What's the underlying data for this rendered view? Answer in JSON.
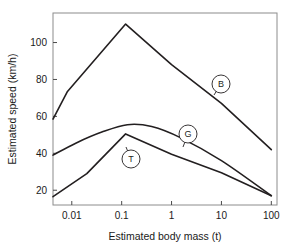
{
  "chart_data": {
    "type": "line",
    "title": "",
    "xlabel": "Estimated body mass (t)",
    "ylabel": "Estimated speed (km/h)",
    "xscale": "log",
    "yscale": "linear",
    "xlim": [
      0.0042,
      130
    ],
    "ylim": [
      12,
      116
    ],
    "grid": false,
    "legend_position": "inline-annotations",
    "xticks": [
      0.01,
      0.1,
      1,
      10,
      100
    ],
    "xtick_labels": [
      "0.01",
      "0.1",
      "1",
      "10",
      "100"
    ],
    "yticks": [
      20,
      40,
      60,
      80,
      100
    ],
    "ytick_labels": [
      "20",
      "40",
      "60",
      "80",
      "100"
    ],
    "line_color": "#231f20",
    "frame_color": "#8c8c8c",
    "series": [
      {
        "name": "B",
        "label": "B",
        "annotation": "B",
        "x": [
          0.0042,
          0.0082,
          0.12,
          1.0,
          10.0,
          100.0
        ],
        "y": [
          58.5,
          73.5,
          110.0,
          88.0,
          67.0,
          42.0
        ]
      },
      {
        "name": "G",
        "label": "G",
        "annotation": "G",
        "x": [
          0.0042,
          0.012,
          0.04,
          0.13,
          0.4,
          1.5,
          10.0,
          100.0
        ],
        "y": [
          39.0,
          45.5,
          51.5,
          55.5,
          54.5,
          48.5,
          36.0,
          17.0
        ]
      },
      {
        "name": "T",
        "label": "T",
        "annotation": "T",
        "x": [
          0.0042,
          0.02,
          0.12,
          1.0,
          10.0,
          100.0
        ],
        "y": [
          16.5,
          29.0,
          50.5,
          39.5,
          29.5,
          17.0
        ]
      }
    ],
    "annotations": [
      {
        "text": "B",
        "cx": 221,
        "cy": 84,
        "r": 9,
        "leader_x": 214,
        "leader_y": 95
      },
      {
        "text": "G",
        "cx": 188,
        "cy": 134,
        "r": 9,
        "leader_x": 183,
        "leader_y": 147
      },
      {
        "text": "T",
        "cx": 131,
        "cy": 159,
        "r": 9,
        "leader_x": 126,
        "leader_y": 147
      }
    ]
  }
}
